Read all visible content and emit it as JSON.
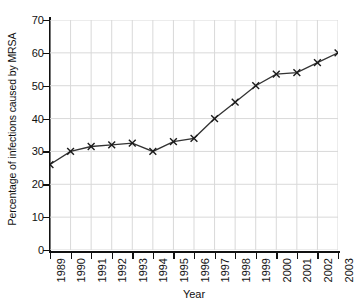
{
  "chart_data": {
    "type": "line",
    "title": "",
    "xlabel": "Year",
    "ylabel": "Percentage of infections caused by MRSA",
    "categories": [
      "1989",
      "1990",
      "1991",
      "1992",
      "1993",
      "1994",
      "1995",
      "1996",
      "1997",
      "1998",
      "1999",
      "2000",
      "2001",
      "2002",
      "2003"
    ],
    "values": [
      26,
      30,
      31.5,
      32,
      32.5,
      30,
      33,
      34,
      40,
      45,
      50,
      53.5,
      54,
      57,
      60
    ],
    "series": [
      {
        "name": "Percentage of infections caused by MRSA",
        "values": [
          26,
          30,
          31.5,
          32,
          32.5,
          30,
          33,
          34,
          40,
          45,
          50,
          53.5,
          54,
          57,
          60
        ]
      }
    ],
    "x": [
      1989,
      1990,
      1991,
      1992,
      1993,
      1994,
      1995,
      1996,
      1997,
      1998,
      1999,
      2000,
      2001,
      2002,
      2003
    ],
    "ylim": [
      0,
      70
    ],
    "xlim": [
      1989,
      2003
    ],
    "y_ticks": [
      0,
      10,
      20,
      30,
      40,
      50,
      60,
      70
    ],
    "y_tick_labels": [
      "0",
      "10",
      "20",
      "30",
      "40",
      "50",
      "60",
      "70"
    ],
    "x_ticks": [
      1989,
      1990,
      1991,
      1992,
      1993,
      1994,
      1995,
      1996,
      1997,
      1998,
      1999,
      2000,
      2001,
      2002,
      2003
    ],
    "x_tick_labels": [
      "1989",
      "1990",
      "1991",
      "1992",
      "1993",
      "1994",
      "1995",
      "1996",
      "1997",
      "1998",
      "1999",
      "2000",
      "2001",
      "2002",
      "2003"
    ],
    "grid": true,
    "grid_color": "#d9d9d9",
    "legend": false,
    "legend_position": "none",
    "marker": "x",
    "line_color": "#333333",
    "marker_color": "#1a1a1a",
    "background_color": "#ffffff",
    "annotations": []
  }
}
